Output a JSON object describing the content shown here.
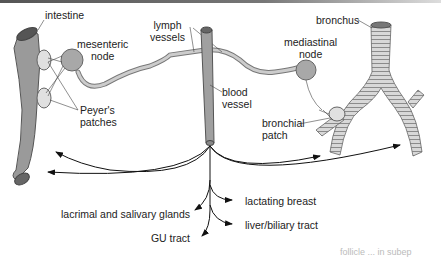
{
  "figure": {
    "type": "anatomical diagram"
  },
  "labels": {
    "intestine": "intestine",
    "mesenteric_node": [
      "mesenteric",
      "node"
    ],
    "peyers_patches": [
      "Peyer's",
      "patches"
    ],
    "lymph_vessels": [
      "lymph",
      "vessels"
    ],
    "blood_vessel": [
      "blood",
      "vessel"
    ],
    "mediastinal_node": [
      "mediastinal",
      "node"
    ],
    "bronchus": "bronchus",
    "bronchial_patch": [
      "bronchial",
      "patch"
    ]
  },
  "destinations": {
    "left": [
      {
        "label": "lacrimal and salivary glands"
      },
      {
        "label": "GU tract"
      }
    ],
    "right": [
      {
        "label": "lactating breast"
      },
      {
        "label": "liver/biliary tract"
      }
    ]
  },
  "footer_fragment": "follicle ... in subep"
}
